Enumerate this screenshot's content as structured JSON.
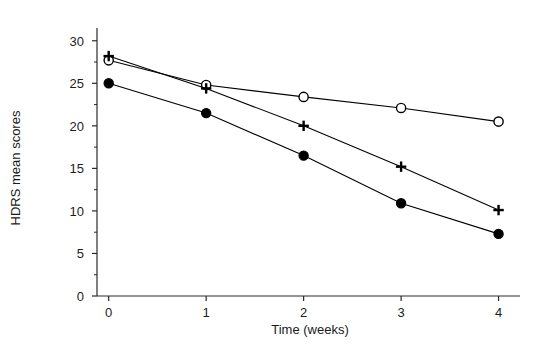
{
  "chart_data": {
    "type": "line",
    "title": "",
    "xlabel": "Time (weeks)",
    "ylabel": "HDRS mean scores",
    "x": [
      0,
      1,
      2,
      3,
      4
    ],
    "xtick_labels": [
      "0",
      "1",
      "2",
      "3",
      "4"
    ],
    "ytick_labels": [
      "0",
      "5",
      "10",
      "15",
      "20",
      "25",
      "30"
    ],
    "ytick_values": [
      0,
      5,
      10,
      15,
      20,
      25,
      30
    ],
    "xlim": [
      -0.12,
      4.22
    ],
    "ylim": [
      0,
      31.5
    ],
    "grid": false,
    "legend": "none",
    "minor_ticks_y": true,
    "series": [
      {
        "name": "open-circle-series",
        "marker": "open-circle",
        "color": "#000000",
        "values": [
          27.7,
          24.8,
          23.4,
          22.1,
          20.5
        ]
      },
      {
        "name": "plus-series",
        "marker": "plus",
        "color": "#000000",
        "values": [
          28.2,
          24.4,
          20.0,
          15.2,
          10.1
        ]
      },
      {
        "name": "filled-circle-series",
        "marker": "filled-circle",
        "color": "#000000",
        "values": [
          25.0,
          21.5,
          16.5,
          10.9,
          7.3
        ]
      }
    ]
  }
}
